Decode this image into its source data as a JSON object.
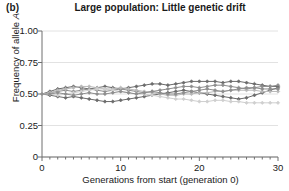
{
  "panel": {
    "label": "(b)"
  },
  "title": "Large population: Little genetic drift",
  "axes": {
    "ylabel_prefix": "Frequency of allele ",
    "ylabel_italic": "A",
    "xlabel": "Generations from start (generation 0)",
    "ytick_labels": [
      "1.00",
      "0.75",
      "0.50",
      "0.25",
      "0"
    ],
    "xtick_labels": [
      "0",
      "10",
      "20",
      "30"
    ]
  },
  "colors": {
    "background": "#ffffff",
    "axis": "#6f6f6f",
    "grid": "#e2e2e2",
    "text": "#1a1a1a",
    "series_dark": "#6b6b6b",
    "series_mid": "#8e8e8e",
    "series_light": "#b9b9b9",
    "series_pale": "#cfcfcf"
  },
  "chart_data": {
    "type": "line",
    "title": "Large population: Little genetic drift",
    "xlabel": "Generations from start (generation 0)",
    "ylabel": "Frequency of allele A",
    "xlim": [
      0,
      30
    ],
    "ylim": [
      0,
      1
    ],
    "yticks": [
      0,
      0.25,
      0.5,
      0.75,
      1.0
    ],
    "xticks": [
      0,
      10,
      20,
      30
    ],
    "xminor_step": 1,
    "grid": true,
    "legend": "none",
    "marker": "diamond",
    "x": [
      0,
      1,
      2,
      3,
      4,
      5,
      6,
      7,
      8,
      9,
      10,
      11,
      12,
      13,
      14,
      15,
      16,
      17,
      18,
      19,
      20,
      21,
      22,
      23,
      24,
      25,
      26,
      27,
      28,
      29,
      30
    ],
    "series": [
      {
        "name": "population-1",
        "color": "#6b6b6b",
        "values": [
          0.5,
          0.52,
          0.54,
          0.55,
          0.56,
          0.55,
          0.54,
          0.55,
          0.56,
          0.55,
          0.54,
          0.55,
          0.56,
          0.57,
          0.58,
          0.58,
          0.57,
          0.58,
          0.59,
          0.6,
          0.6,
          0.6,
          0.6,
          0.59,
          0.6,
          0.6,
          0.59,
          0.58,
          0.57,
          0.56,
          0.56
        ]
      },
      {
        "name": "population-2",
        "color": "#8e8e8e",
        "values": [
          0.5,
          0.51,
          0.52,
          0.53,
          0.52,
          0.53,
          0.54,
          0.53,
          0.52,
          0.53,
          0.54,
          0.53,
          0.52,
          0.51,
          0.52,
          0.53,
          0.54,
          0.55,
          0.56,
          0.56,
          0.55,
          0.56,
          0.57,
          0.57,
          0.56,
          0.55,
          0.54,
          0.55,
          0.56,
          0.56,
          0.57
        ]
      },
      {
        "name": "population-3",
        "color": "#6b6b6b",
        "values": [
          0.5,
          0.49,
          0.48,
          0.47,
          0.48,
          0.47,
          0.46,
          0.45,
          0.44,
          0.44,
          0.45,
          0.46,
          0.47,
          0.48,
          0.49,
          0.5,
          0.51,
          0.52,
          0.53,
          0.52,
          0.51,
          0.5,
          0.49,
          0.48,
          0.47,
          0.46,
          0.47,
          0.49,
          0.51,
          0.53,
          0.55
        ]
      },
      {
        "name": "population-4",
        "color": "#b9b9b9",
        "values": [
          0.5,
          0.51,
          0.53,
          0.54,
          0.55,
          0.56,
          0.56,
          0.55,
          0.54,
          0.54,
          0.55,
          0.54,
          0.53,
          0.52,
          0.51,
          0.5,
          0.49,
          0.49,
          0.5,
          0.5,
          0.51,
          0.51,
          0.52,
          0.52,
          0.53,
          0.53,
          0.53,
          0.53,
          0.52,
          0.52,
          0.52
        ]
      },
      {
        "name": "population-5",
        "color": "#cfcfcf",
        "values": [
          0.5,
          0.5,
          0.49,
          0.5,
          0.51,
          0.52,
          0.53,
          0.54,
          0.54,
          0.53,
          0.52,
          0.51,
          0.5,
          0.5,
          0.49,
          0.48,
          0.47,
          0.46,
          0.46,
          0.45,
          0.44,
          0.44,
          0.45,
          0.45,
          0.44,
          0.44,
          0.43,
          0.43,
          0.43,
          0.43,
          0.43
        ]
      },
      {
        "name": "population-6",
        "color": "#8e8e8e",
        "values": [
          0.5,
          0.5,
          0.51,
          0.5,
          0.49,
          0.5,
          0.51,
          0.5,
          0.5,
          0.51,
          0.52,
          0.51,
          0.5,
          0.51,
          0.52,
          0.51,
          0.5,
          0.5,
          0.51,
          0.52,
          0.53,
          0.54,
          0.53,
          0.52,
          0.53,
          0.54,
          0.55,
          0.55,
          0.54,
          0.54,
          0.54
        ]
      }
    ]
  }
}
